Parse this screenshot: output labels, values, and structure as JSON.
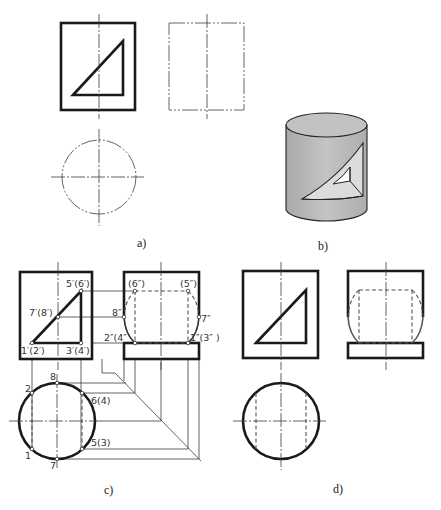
{
  "figure": {
    "panels": [
      {
        "id": "a",
        "caption": "a)",
        "description": "Given views: front view of cylinder with triangular cut-out, incomplete side view (phantom), top view (phantom circle)"
      },
      {
        "id": "b",
        "caption": "b)",
        "description": "Pictorial of cylinder with triangular prism cut through it"
      },
      {
        "id": "c",
        "caption": "c)",
        "description": "Construction with labeled projection points"
      },
      {
        "id": "d",
        "caption": "d)",
        "description": "Completed three views"
      }
    ],
    "labels_c": {
      "front": {
        "p56": "5′(6′)",
        "p78": "7′(8′)",
        "p12": "1′(2′)",
        "p34": "3′(4′)"
      },
      "side": {
        "p6": "(6″)",
        "p5": "(5″)",
        "p8": "8″",
        "p7": "7″",
        "p24": "2″(4″",
        "p13": "1″(3″ )"
      },
      "top": {
        "p8": "8",
        "p2": "2",
        "p64": "6(4)",
        "p53": "5(3)",
        "p1": "1",
        "p7": "7"
      }
    },
    "colors": {
      "line": "#1a1a1a",
      "cylinder_fill": "#b8b8b8",
      "cut_face_light": "#e2e2e2",
      "background": "#ffffff"
    }
  }
}
